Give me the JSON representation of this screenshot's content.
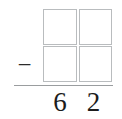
{
  "worksheet": {
    "type": "vertical-subtraction-problem",
    "operator": "−",
    "answer_boxes": [
      {
        "position": "top-left",
        "value": ""
      },
      {
        "position": "top-right",
        "value": ""
      },
      {
        "position": "bottom-left",
        "value": ""
      },
      {
        "position": "bottom-right",
        "value": ""
      }
    ],
    "result_digits": [
      {
        "place": "tens",
        "value": "6"
      },
      {
        "place": "ones",
        "value": "2"
      }
    ],
    "colors": {
      "background": "#ffffff",
      "box_border": "#b9bcbe",
      "rule": "#9a9d9f",
      "digit_text": "#1c1c1c",
      "operator_text": "#2b2b2b"
    }
  }
}
